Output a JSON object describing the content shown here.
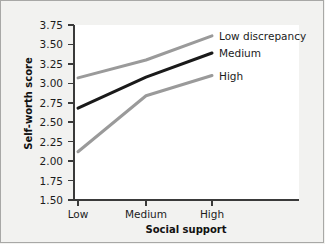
{
  "chart_data": {
    "type": "line",
    "title": "",
    "xlabel": "Social support",
    "ylabel": "Self-worth score",
    "categories": [
      "Low",
      "Medium",
      "High"
    ],
    "ylim": [
      1.5,
      3.75
    ],
    "yticks": [
      "3.75",
      "3.50",
      "3.25",
      "3.00",
      "2.75",
      "2.50",
      "2.25",
      "2.00",
      "1.75",
      "1.50"
    ],
    "ytick_values": [
      3.75,
      3.5,
      3.25,
      3.0,
      2.75,
      2.5,
      2.25,
      2.0,
      1.75,
      1.5
    ],
    "grid": false,
    "legend_position": "right-inline",
    "series": [
      {
        "name": "Low discrepancy",
        "values": [
          3.07,
          3.3,
          3.61
        ],
        "color": "#9a9a9a",
        "width": 3.0
      },
      {
        "name": "Medium",
        "values": [
          2.68,
          3.08,
          3.39
        ],
        "color": "#1a1a1a",
        "width": 3.0
      },
      {
        "name": "High",
        "values": [
          2.12,
          2.84,
          3.1
        ],
        "color": "#9a9a9a",
        "width": 3.0
      }
    ]
  },
  "figure": {
    "background_color": "#f2f2f0",
    "panel_color": "#ffffff",
    "axis_color": "#3a3a3a",
    "text_color": "#1c1c1c"
  }
}
